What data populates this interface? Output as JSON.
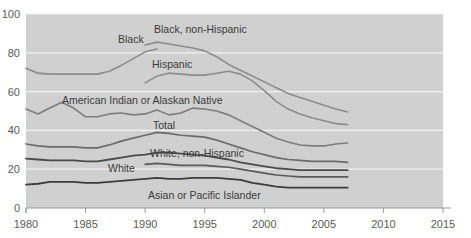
{
  "chart_data": {
    "type": "line",
    "title": "",
    "partial_top_text": "",
    "xlabel": "",
    "ylabel": "",
    "xlim": [
      1980,
      2015
    ],
    "ylim": [
      0,
      100
    ],
    "xticks": [
      1980,
      1985,
      1990,
      1995,
      2000,
      2005,
      2010,
      2015
    ],
    "yticks": [
      0,
      20,
      40,
      60,
      80,
      100
    ],
    "grid": true,
    "grid_axis": "y",
    "legend": "inline-labels",
    "plot_background": "#d0d0d0",
    "gridline_color": "#f2f2f2",
    "series": [
      {
        "name": "Black",
        "label": "Black",
        "color": "#8c8c8c",
        "width": 1.6,
        "x": [
          1980,
          1981,
          1982,
          1983,
          1984,
          1985,
          1986,
          1987,
          1988,
          1989,
          1990,
          1991
        ],
        "values": [
          72.0,
          69.5,
          69.0,
          69.0,
          69.0,
          69.0,
          69.0,
          70.5,
          73.5,
          77.0,
          80.5,
          82.0
        ]
      },
      {
        "name": "Black, non-Hispanic",
        "label": "Black, non-Hispanic",
        "color": "#8c8c8c",
        "width": 1.6,
        "x": [
          1990,
          1991,
          1992,
          1993,
          1994,
          1995,
          1996,
          1997,
          1998,
          1999,
          2000,
          2001,
          2002,
          2003,
          2004,
          2005,
          2006,
          2007
        ],
        "values": [
          84.0,
          85.5,
          84.5,
          83.5,
          82.5,
          81.0,
          78.0,
          74.0,
          71.0,
          68.0,
          65.0,
          62.0,
          59.0,
          57.0,
          55.0,
          53.0,
          51.0,
          49.5
        ]
      },
      {
        "name": "Hispanic",
        "label": "Hispanic",
        "color": "#8c8c8c",
        "width": 1.6,
        "x": [
          1990,
          1991,
          1992,
          1993,
          1994,
          1995,
          1996,
          1997,
          1998,
          1999,
          2000,
          2001,
          2002,
          2003,
          2004,
          2005,
          2006,
          2007
        ],
        "values": [
          64.5,
          68.0,
          69.5,
          69.0,
          68.5,
          68.5,
          69.5,
          70.5,
          69.0,
          65.5,
          60.5,
          55.0,
          51.0,
          48.5,
          46.5,
          45.0,
          43.5,
          43.0
        ]
      },
      {
        "name": "American Indian or Alaskan Native",
        "label": "American Indian or Alaskan Native",
        "color": "#7d7d7d",
        "width": 1.6,
        "x": [
          1980,
          1981,
          1982,
          1983,
          1984,
          1985,
          1986,
          1987,
          1988,
          1989,
          1990,
          1991,
          1992,
          1993,
          1994,
          1995,
          1996,
          1997,
          1998,
          1999,
          2000,
          2001,
          2002,
          2003,
          2004,
          2005,
          2006,
          2007
        ],
        "values": [
          51.0,
          48.5,
          51.5,
          54.5,
          51.5,
          47.0,
          47.0,
          48.5,
          49.0,
          48.0,
          48.5,
          50.5,
          48.0,
          49.0,
          51.5,
          51.0,
          50.0,
          48.0,
          45.0,
          42.0,
          39.0,
          36.0,
          34.0,
          32.5,
          32.0,
          32.0,
          33.0,
          33.5
        ]
      },
      {
        "name": "Total",
        "label": "Total",
        "color": "#6b6b6b",
        "width": 1.7,
        "x": [
          1980,
          1981,
          1982,
          1983,
          1984,
          1985,
          1986,
          1987,
          1988,
          1989,
          1990,
          1991,
          1992,
          1993,
          1994,
          1995,
          1996,
          1997,
          1998,
          1999,
          2000,
          2001,
          2002,
          2003,
          2004,
          2005,
          2006,
          2007
        ],
        "values": [
          33.0,
          32.0,
          31.5,
          31.5,
          31.5,
          31.0,
          31.0,
          32.5,
          34.5,
          36.0,
          37.5,
          39.0,
          38.5,
          37.5,
          37.0,
          36.5,
          35.0,
          33.0,
          31.0,
          29.0,
          27.5,
          26.0,
          25.0,
          24.5,
          24.0,
          24.0,
          24.0,
          23.5
        ]
      },
      {
        "name": "White, non-Hispanic",
        "label": "White, non-Hispanic",
        "color": "#5a5a5a",
        "width": 1.7,
        "x": [
          1990,
          1991,
          1992,
          1993,
          1994,
          1995,
          1996,
          1997,
          1998,
          1999,
          2000,
          2001,
          2002,
          2003,
          2004,
          2005,
          2006,
          2007
        ],
        "values": [
          22.5,
          23.0,
          22.5,
          22.0,
          22.0,
          22.0,
          21.5,
          21.0,
          20.0,
          19.0,
          18.0,
          17.0,
          16.5,
          16.0,
          16.0,
          16.0,
          16.0,
          16.0
        ]
      },
      {
        "name": "White",
        "label": "White",
        "color": "#4a4a4a",
        "width": 1.8,
        "x": [
          1980,
          1981,
          1982,
          1983,
          1984,
          1985,
          1986,
          1987,
          1988,
          1989,
          1990,
          1991,
          1992,
          1993,
          1994,
          1995,
          1996,
          1997,
          1998,
          1999,
          2000,
          2001,
          2002,
          2003,
          2004,
          2005,
          2006,
          2007
        ],
        "values": [
          25.5,
          25.0,
          24.5,
          24.5,
          24.5,
          24.0,
          24.0,
          25.0,
          26.0,
          27.0,
          27.5,
          28.5,
          28.5,
          28.0,
          27.5,
          27.0,
          26.0,
          25.0,
          23.5,
          22.5,
          21.5,
          20.5,
          20.0,
          19.5,
          19.5,
          19.5,
          19.5,
          19.5
        ]
      },
      {
        "name": "Asian or Pacific Islander",
        "label": "Asian or Pacific Islander",
        "color": "#3c3c3c",
        "width": 1.8,
        "x": [
          1980,
          1981,
          1982,
          1983,
          1984,
          1985,
          1986,
          1987,
          1988,
          1989,
          1990,
          1991,
          1992,
          1993,
          1994,
          1995,
          1996,
          1997,
          1998,
          1999,
          2000,
          2001,
          2002,
          2003,
          2004,
          2005,
          2006,
          2007
        ],
        "values": [
          12.0,
          12.5,
          13.5,
          13.5,
          13.5,
          13.0,
          13.0,
          13.5,
          14.0,
          14.5,
          15.0,
          15.5,
          15.0,
          15.0,
          15.5,
          15.5,
          15.5,
          15.0,
          14.5,
          13.0,
          12.0,
          11.0,
          10.5,
          10.5,
          10.5,
          10.5,
          10.5,
          10.5
        ]
      }
    ],
    "annotations": [
      {
        "text": "Black",
        "x": 118,
        "y": 43
      },
      {
        "text": "Black, non-Hispanic",
        "x": 154,
        "y": 33
      },
      {
        "text": "Hispanic",
        "x": 152,
        "y": 68
      },
      {
        "text": "American Indian or Alaskan Native",
        "x": 62,
        "y": 104
      },
      {
        "text": "Total",
        "x": 153,
        "y": 129
      },
      {
        "text": "White, non-Hispanic",
        "x": 150,
        "y": 157
      },
      {
        "text": "White",
        "x": 108,
        "y": 172
      },
      {
        "text": "Asian or Pacific Islander",
        "x": 148,
        "y": 199
      }
    ]
  }
}
